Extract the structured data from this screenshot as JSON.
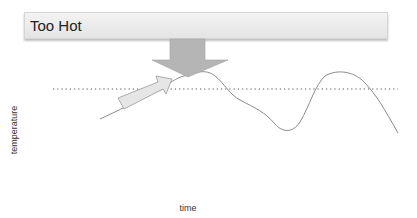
{
  "banner": {
    "label": "Too Hot"
  },
  "axes": {
    "xlabel": "time",
    "ylabel": "temperature"
  },
  "colors": {
    "banner_fill": "#e8e8e8",
    "down_arrow_fill": "#b5b5b5",
    "up_arrow_fill": "#e6e6e6",
    "curve": "#888888",
    "threshold": "#555555"
  },
  "elements": {
    "threshold_line": "dotted horizontal threshold",
    "down_arrow": "arrow-down-icon pressing from banner",
    "up_arrow": "arrow-up-right-icon rising temperature"
  }
}
